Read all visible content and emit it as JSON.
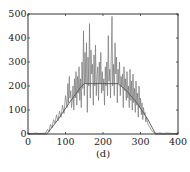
{
  "chart_data": {
    "type": "line",
    "title": "",
    "caption": "(d)",
    "xlabel": "",
    "ylabel": "",
    "xlim": [
      0,
      400
    ],
    "ylim": [
      0,
      500
    ],
    "xticks": [
      0,
      100,
      200,
      300,
      400
    ],
    "yticks": [
      0,
      100,
      200,
      300,
      400,
      500
    ],
    "grid": false,
    "legend": null,
    "series": [
      {
        "name": "noisy signal",
        "color": "#777777",
        "x": [
          0,
          10,
          20,
          30,
          40,
          48,
          52,
          56,
          60,
          64,
          68,
          72,
          76,
          80,
          84,
          88,
          92,
          96,
          100,
          104,
          106,
          108,
          110,
          112,
          114,
          116,
          118,
          120,
          122,
          124,
          126,
          128,
          130,
          132,
          134,
          136,
          138,
          140,
          142,
          144,
          146,
          148,
          150,
          152,
          154,
          156,
          158,
          160,
          162,
          164,
          166,
          168,
          170,
          172,
          174,
          176,
          178,
          180,
          182,
          184,
          186,
          188,
          190,
          192,
          194,
          196,
          198,
          200,
          202,
          204,
          206,
          208,
          210,
          212,
          214,
          216,
          218,
          220,
          222,
          224,
          226,
          228,
          230,
          232,
          234,
          236,
          238,
          240,
          242,
          244,
          246,
          248,
          250,
          252,
          254,
          256,
          258,
          260,
          262,
          264,
          266,
          268,
          270,
          272,
          274,
          276,
          278,
          280,
          282,
          284,
          286,
          288,
          290,
          292,
          294,
          296,
          298,
          300,
          302,
          304,
          306,
          308,
          310,
          312,
          314,
          316,
          318,
          320,
          324,
          328,
          332,
          336,
          340,
          345,
          350,
          360,
          370,
          380,
          390,
          400
        ],
        "y": [
          3,
          2,
          4,
          2,
          3,
          5,
          20,
          10,
          40,
          25,
          60,
          45,
          80,
          55,
          95,
          70,
          120,
          85,
          160,
          110,
          210,
          130,
          240,
          150,
          180,
          110,
          140,
          200,
          100,
          230,
          150,
          260,
          120,
          240,
          170,
          280,
          140,
          230,
          110,
          300,
          190,
          430,
          160,
          340,
          210,
          380,
          90,
          320,
          200,
          460,
          150,
          350,
          250,
          290,
          120,
          330,
          200,
          370,
          160,
          240,
          280,
          140,
          300,
          210,
          340,
          170,
          260,
          180,
          230,
          120,
          280,
          200,
          300,
          160,
          410,
          220,
          270,
          150,
          330,
          490,
          200,
          290,
          160,
          380,
          250,
          320,
          130,
          270,
          210,
          300,
          160,
          240,
          200,
          250,
          110,
          280,
          180,
          230,
          140,
          260,
          150,
          200,
          110,
          270,
          140,
          220,
          100,
          250,
          130,
          190,
          90,
          220,
          120,
          170,
          70,
          200,
          110,
          150,
          80,
          130,
          60,
          110,
          80,
          90,
          50,
          70,
          55,
          40,
          30,
          20,
          10,
          6,
          4,
          3,
          5,
          2,
          4,
          3,
          2,
          3
        ]
      },
      {
        "name": "envelope",
        "color": "#555555",
        "x": [
          0,
          50,
          80,
          110,
          140,
          150,
          240,
          260,
          290,
          320,
          340,
          400
        ],
        "y": [
          0,
          0,
          60,
          130,
          195,
          210,
          210,
          185,
          130,
          60,
          0,
          0
        ]
      }
    ]
  }
}
